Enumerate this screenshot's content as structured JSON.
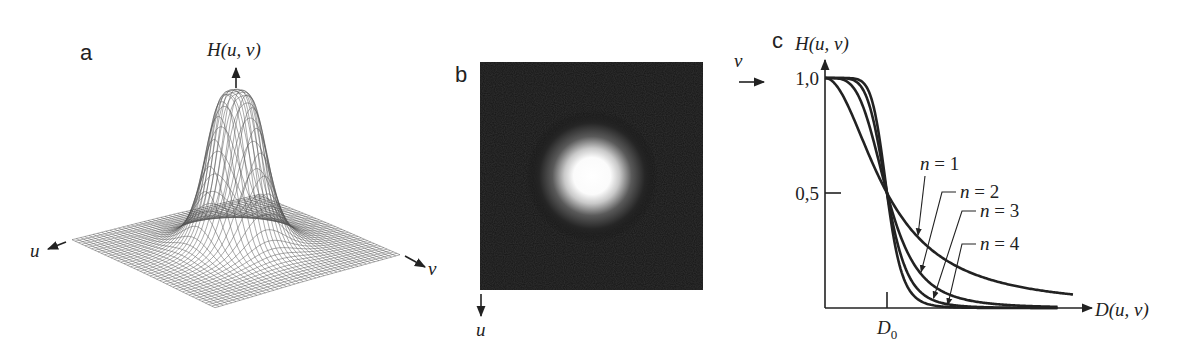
{
  "figure": {
    "panels": [
      {
        "id": "a",
        "label": "a",
        "type": "3d-surface",
        "description": "Butterworth lowpass filter transfer function as mesh surface",
        "axis_vertical": "H(u, v)",
        "axis_left": "u",
        "axis_right": "v"
      },
      {
        "id": "b",
        "label": "b",
        "type": "image",
        "description": "Filter displayed as image: bright center on dark background",
        "axis_right": "v",
        "axis_down": "u",
        "colors": {
          "background": "#141414",
          "center": "#ffffff"
        }
      },
      {
        "id": "c",
        "label": "c",
        "type": "line-plot"
      }
    ]
  },
  "chart_data": {
    "type": "line",
    "title": "",
    "xlabel": "D(u, v)",
    "ylabel": "H(u, v)",
    "x_unit": "D/D0",
    "xlim": [
      0,
      4.3
    ],
    "ylim": [
      0,
      1.0
    ],
    "yticks": [
      {
        "value": 1.0,
        "label": "1,0"
      },
      {
        "value": 0.5,
        "label": "0,5"
      }
    ],
    "xticks": [
      {
        "value": 1.0,
        "label": "D0",
        "base": "D",
        "sub": "0"
      }
    ],
    "formula": "H = 1 / (1 + (D/D0)^(2n))",
    "grid": false,
    "legend": "inline-annotations",
    "series": [
      {
        "name": "n = 1",
        "n": 1,
        "x_end": 4.0
      },
      {
        "name": "n = 2",
        "n": 2,
        "x_end": 3.75
      },
      {
        "name": "n = 3",
        "n": 3,
        "x_end": 3.75
      },
      {
        "name": "n = 4",
        "n": 4,
        "x_end": 3.75
      }
    ],
    "annotations": [
      {
        "text": "n = 1",
        "series": 0,
        "n_sym": "n",
        "eq": "= 1",
        "point_x": 1.5
      },
      {
        "text": "n = 2",
        "series": 1,
        "n_sym": "n",
        "eq": "= 2",
        "point_x": 1.55
      },
      {
        "text": "n = 3",
        "series": 2,
        "n_sym": "n",
        "eq": "= 3",
        "point_x": 1.75
      },
      {
        "text": "n = 4",
        "series": 3,
        "n_sym": "n",
        "eq": "= 4",
        "point_x": 1.98
      }
    ]
  }
}
